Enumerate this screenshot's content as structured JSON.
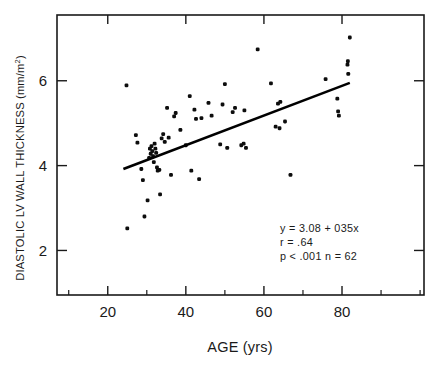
{
  "chart_data": {
    "type": "scatter",
    "title": "",
    "xlabel": "AGE (yrs)",
    "ylabel_main": "DIASTOLIC LV WALL THICKNESS (mm/m",
    "ylabel_sup": "2",
    "ylabel_close": ")",
    "ylabel_full": "DIASTOLIC LV WALL THICKNESS (mm/m2)",
    "xlim": [
      7,
      101
    ],
    "ylim": [
      0.95,
      7.55
    ],
    "xticks": [
      20,
      40,
      60,
      80
    ],
    "xtick_labels": [
      "20",
      "40",
      "60",
      "80"
    ],
    "xminor_ticks": [
      10,
      30,
      50,
      70,
      90,
      100
    ],
    "yticks": [
      2,
      4,
      6
    ],
    "ytick_labels": [
      "2",
      "4",
      "6"
    ],
    "grid": false,
    "legend": null,
    "point_color": "#0d0d0d",
    "line_color": "#000000",
    "frame_color": "#1a1a1a",
    "regression": {
      "equation_label": "y  =  3.08 + 035x",
      "r_label": "r  =  .64",
      "p_n_label": "p <  .001  n  =  62",
      "slope": 0.035,
      "intercept": 3.08,
      "r": 0.64,
      "p": "<.001",
      "n": 62,
      "x_start": 24,
      "y_start": 3.92,
      "x_end": 82,
      "y_end": 5.95
    },
    "points": [
      [
        25.0,
        2.52
      ],
      [
        24.8,
        5.89
      ],
      [
        27.2,
        4.72
      ],
      [
        27.6,
        4.54
      ],
      [
        28.6,
        3.92
      ],
      [
        29.0,
        3.66
      ],
      [
        29.4,
        2.8
      ],
      [
        30.2,
        3.18
      ],
      [
        30.6,
        4.18
      ],
      [
        30.8,
        4.4
      ],
      [
        31.0,
        4.28
      ],
      [
        31.2,
        4.46
      ],
      [
        31.4,
        4.34
      ],
      [
        31.6,
        4.22
      ],
      [
        31.8,
        4.08
      ],
      [
        32.0,
        4.52
      ],
      [
        32.2,
        4.4
      ],
      [
        32.4,
        4.3
      ],
      [
        32.6,
        3.96
      ],
      [
        32.8,
        3.88
      ],
      [
        33.2,
        3.9
      ],
      [
        33.4,
        3.32
      ],
      [
        33.8,
        4.64
      ],
      [
        34.2,
        4.74
      ],
      [
        34.6,
        4.56
      ],
      [
        35.2,
        5.36
      ],
      [
        35.6,
        4.66
      ],
      [
        36.2,
        3.78
      ],
      [
        37.0,
        5.16
      ],
      [
        37.4,
        5.24
      ],
      [
        38.6,
        4.84
      ],
      [
        40.0,
        4.48
      ],
      [
        41.0,
        5.64
      ],
      [
        41.4,
        3.88
      ],
      [
        42.2,
        5.32
      ],
      [
        42.6,
        5.1
      ],
      [
        43.4,
        3.68
      ],
      [
        44.0,
        5.12
      ],
      [
        45.8,
        5.48
      ],
      [
        46.6,
        5.18
      ],
      [
        48.8,
        4.5
      ],
      [
        49.4,
        5.44
      ],
      [
        50.0,
        5.92
      ],
      [
        50.6,
        4.42
      ],
      [
        52.0,
        5.26
      ],
      [
        52.6,
        5.36
      ],
      [
        54.2,
        4.48
      ],
      [
        54.8,
        4.52
      ],
      [
        55.0,
        5.3
      ],
      [
        55.4,
        4.42
      ],
      [
        58.4,
        6.74
      ],
      [
        61.8,
        5.94
      ],
      [
        63.0,
        4.92
      ],
      [
        63.6,
        5.46
      ],
      [
        64.2,
        5.5
      ],
      [
        64.0,
        4.88
      ],
      [
        65.4,
        5.04
      ],
      [
        66.8,
        3.78
      ],
      [
        75.8,
        6.04
      ],
      [
        78.8,
        5.58
      ],
      [
        79.0,
        5.28
      ],
      [
        79.2,
        5.18
      ],
      [
        81.4,
        6.38
      ],
      [
        81.5,
        6.46
      ],
      [
        81.6,
        6.16
      ],
      [
        82.0,
        7.02
      ]
    ]
  },
  "annotation": {
    "line1": "y  =  3.08 + 035x",
    "line2": "r  =  .64",
    "line3": "p <  .001  n  =  62"
  }
}
